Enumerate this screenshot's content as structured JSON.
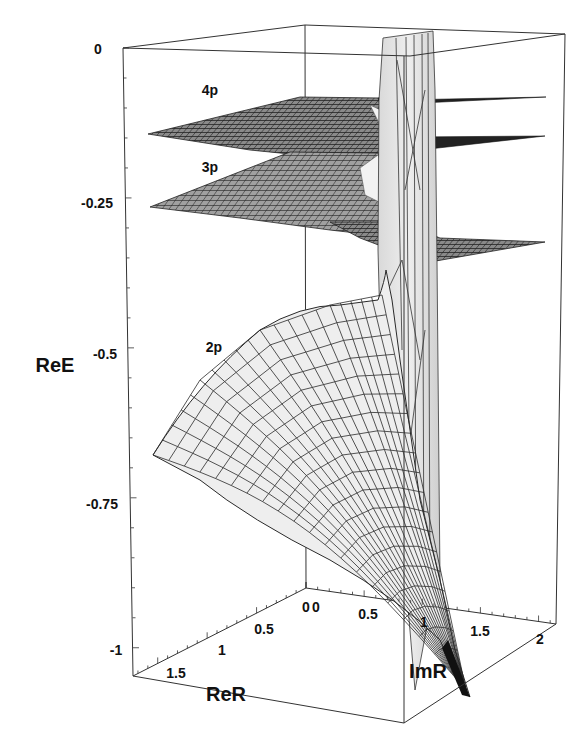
{
  "chart_data": {
    "type": "surface3d",
    "title": "",
    "zlabel": "ReE",
    "xlabel": "ReR",
    "ylabel": "ImR",
    "zlim": [
      -1,
      0
    ],
    "xlim": [
      0,
      1.75
    ],
    "ylim": [
      0,
      2.1
    ],
    "z_ticks": [
      "0",
      "-0.25",
      "-0.5",
      "-0.75",
      "-1"
    ],
    "x_ticks": [
      "0",
      "0.5",
      "1",
      "1.5"
    ],
    "y_ticks": [
      "0",
      "0.5",
      "1",
      "1.5",
      "2"
    ],
    "grid": false,
    "series": [
      {
        "name": "4p",
        "approx_ReE_plateau": -0.125,
        "label": "4p"
      },
      {
        "name": "3p",
        "approx_ReE_plateau": -0.21,
        "label": "3p"
      },
      {
        "name": "2p",
        "approx_ReE_range": [
          -1.0,
          -0.42
        ],
        "label": "2p"
      }
    ],
    "annotations": [
      "vertical branch-cut sheet near ImR ≈ 1.2 extending from ReE ≈ -1 to 0"
    ]
  },
  "colors": {
    "surface_fill": "#e8e8e8",
    "surface_dark": "#555555",
    "mesh_line": "#2a2a2a",
    "axis_line": "#333333",
    "background": "#ffffff"
  }
}
